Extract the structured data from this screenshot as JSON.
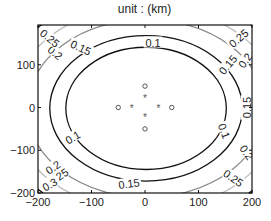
{
  "chart_data": {
    "type": "contour",
    "title": "unit : (km)",
    "xlabel": "",
    "ylabel": "",
    "xlim": [
      -200,
      200
    ],
    "ylim": [
      -200,
      193
    ],
    "x_ticks": [
      -200,
      -100,
      0,
      100,
      200
    ],
    "y_ticks": [
      -200,
      -100,
      0,
      100
    ],
    "grid": false,
    "levels": [
      {
        "value": 0.1,
        "label": "0.1",
        "color": "#111111",
        "rx_km": 150,
        "ry_km": 143
      },
      {
        "value": 0.15,
        "label": "0.15",
        "color": "#111111",
        "rx_km": 180,
        "ry_km": 170
      },
      {
        "value": 0.2,
        "label": "0.2",
        "color": "#8c8c8c",
        "rx_km": 222,
        "ry_km": 208
      },
      {
        "value": 0.25,
        "label": "0.25",
        "color": "#bdbdbd",
        "rx_km": 252,
        "ry_km": 240
      },
      {
        "value": 0.3,
        "label": "0.3",
        "color": "#111111",
        "rx_km": 283,
        "ry_km": 270
      },
      {
        "value": 0.35,
        "label": "",
        "color": "#111111",
        "rx_km": 315,
        "ry_km": 300
      }
    ],
    "contour_center_km": [
      2,
      -2
    ],
    "markers": {
      "circles": [
        [
          0,
          50
        ],
        [
          -50,
          0
        ],
        [
          50,
          0
        ],
        [
          0,
          -50
        ]
      ],
      "stars": [
        [
          0,
          22
        ],
        [
          -25,
          0
        ],
        [
          25,
          0
        ],
        [
          0,
          -22
        ]
      ]
    },
    "contour_labels": [
      {
        "text": "0.1",
        "x": 15,
        "y": 152,
        "angle": 0
      },
      {
        "text": "0.15",
        "x": -120,
        "y": 140,
        "angle": -25
      },
      {
        "text": "0.2",
        "x": -168,
        "y": 128,
        "angle": -40
      },
      {
        "text": "0.25",
        "x": -178,
        "y": 162,
        "angle": -40
      },
      {
        "text": "0.25",
        "x": 175,
        "y": 162,
        "angle": 40
      },
      {
        "text": "0.2",
        "x": 187,
        "y": 110,
        "angle": 55
      },
      {
        "text": "0.15",
        "x": 155,
        "y": 100,
        "angle": 50
      },
      {
        "text": "0.15",
        "x": 190,
        "y": 0,
        "angle": 90
      },
      {
        "text": "0.1",
        "x": 148,
        "y": -55,
        "angle": -70
      },
      {
        "text": "0.1",
        "x": -135,
        "y": -70,
        "angle": 30
      },
      {
        "text": "0.2",
        "x": 190,
        "y": -105,
        "angle": -55
      },
      {
        "text": "0.2",
        "x": -172,
        "y": -140,
        "angle": 35
      },
      {
        "text": "0.25",
        "x": -162,
        "y": -162,
        "angle": 35
      },
      {
        "text": "0.3",
        "x": -178,
        "y": -180,
        "angle": 30
      },
      {
        "text": "0.15",
        "x": -30,
        "y": -178,
        "angle": 8
      },
      {
        "text": "0.25",
        "x": 165,
        "y": -165,
        "angle": -35
      }
    ]
  }
}
